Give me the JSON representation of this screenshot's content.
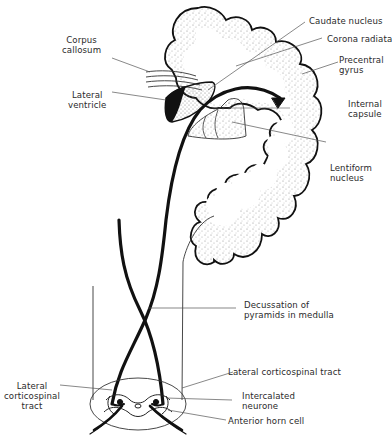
{
  "diagram": {
    "labels": {
      "corpus_callosum": "Corpus\ncallosum",
      "lateral_ventricle": "Lateral\nventricle",
      "caudate_nucleus": "Caudate nucleus",
      "corona_radiata": "Corona radiata",
      "precentral_gyrus": "Precentral\ngyrus",
      "internal_capsule": "Internal\ncapsule",
      "lentiform_nucleus": "Lentiform\nnucleus",
      "decussation": "Decussation of\npyramids in medulla",
      "lateral_corticospinal_tract_right": "Lateral corticospinal tract",
      "intercalated_neurone": "Intercalated\nneurone",
      "anterior_horn_cell": "Anterior horn cell",
      "lateral_corticospinal_tract_left": "Lateral\ncorticospinal\ntract"
    },
    "colors": {
      "ink": "#111111",
      "stipple": "#9a9a9a",
      "leader": "#555555",
      "background": "#ffffff"
    }
  }
}
